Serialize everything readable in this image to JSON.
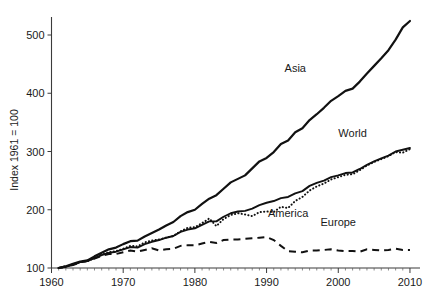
{
  "chart_data": {
    "type": "line",
    "title": "",
    "subtitle": "",
    "xlabel": "",
    "ylabel": "Index 1961 = 100",
    "xlim": [
      1960,
      2010
    ],
    "ylim": [
      100,
      540
    ],
    "grid": false,
    "legend_position": "inline-labels",
    "x_ticks": [
      "1960",
      "1970",
      "1980",
      "1990",
      "2000",
      "2010"
    ],
    "x_tick_values": [
      1960,
      1970,
      1980,
      1990,
      2000,
      2010
    ],
    "y_ticks": [
      "100",
      "200",
      "300",
      "400",
      "500"
    ],
    "y_tick_values": [
      100,
      200,
      300,
      400,
      500
    ],
    "x": [
      1961,
      1962,
      1963,
      1964,
      1965,
      1966,
      1967,
      1968,
      1969,
      1970,
      1971,
      1972,
      1973,
      1974,
      1975,
      1976,
      1977,
      1978,
      1979,
      1980,
      1981,
      1982,
      1983,
      1984,
      1985,
      1986,
      1987,
      1988,
      1989,
      1990,
      1991,
      1992,
      1993,
      1994,
      1995,
      1996,
      1997,
      1998,
      1999,
      2000,
      2001,
      2002,
      2003,
      2004,
      2005,
      2006,
      2007,
      2008,
      2009,
      2010
    ],
    "series": [
      {
        "name": "Asia",
        "style": "solid-thick",
        "label_x": 1994,
        "label_y": 437,
        "values": [
          100,
          103,
          107,
          111,
          113,
          120,
          126,
          132,
          135,
          141,
          146,
          147,
          154,
          160,
          166,
          173,
          179,
          189,
          196,
          200,
          210,
          219,
          225,
          236,
          247,
          253,
          259,
          271,
          283,
          289,
          299,
          313,
          319,
          333,
          340,
          354,
          364,
          375,
          387,
          395,
          404,
          408,
          420,
          434,
          447,
          460,
          474,
          492,
          513,
          524
        ]
      },
      {
        "name": "World",
        "style": "solid-thin",
        "label_x": 2002,
        "label_y": 325,
        "values": [
          100,
          102,
          106,
          110,
          112,
          117,
          122,
          126,
          128,
          132,
          136,
          135,
          141,
          145,
          148,
          152,
          155,
          162,
          166,
          168,
          174,
          180,
          180,
          188,
          194,
          197,
          198,
          202,
          208,
          212,
          215,
          220,
          222,
          228,
          232,
          241,
          246,
          250,
          256,
          259,
          263,
          264,
          270,
          277,
          283,
          288,
          293,
          300,
          303,
          306
        ]
      },
      {
        "name": "America",
        "style": "dotted",
        "label_x": 1993,
        "label_y": 188,
        "values": [
          100,
          102,
          106,
          110,
          112,
          117,
          123,
          127,
          129,
          133,
          138,
          137,
          144,
          147,
          149,
          152,
          155,
          163,
          169,
          170,
          177,
          185,
          172,
          184,
          191,
          194,
          192,
          189,
          196,
          197,
          196,
          205,
          203,
          215,
          222,
          233,
          240,
          245,
          252,
          256,
          260,
          261,
          268,
          276,
          282,
          287,
          292,
          299,
          298,
          304
        ]
      },
      {
        "name": "Europe",
        "style": "dashed",
        "label_x": 2000,
        "label_y": 172,
        "values": [
          100,
          103,
          105,
          110,
          112,
          116,
          121,
          124,
          124,
          127,
          130,
          128,
          131,
          134,
          130,
          132,
          133,
          138,
          139,
          139,
          142,
          145,
          143,
          148,
          149,
          149,
          150,
          151,
          152,
          153,
          148,
          138,
          129,
          128,
          127,
          130,
          130,
          131,
          132,
          130,
          129,
          129,
          128,
          132,
          131,
          130,
          131,
          133,
          131,
          131
        ]
      }
    ]
  }
}
